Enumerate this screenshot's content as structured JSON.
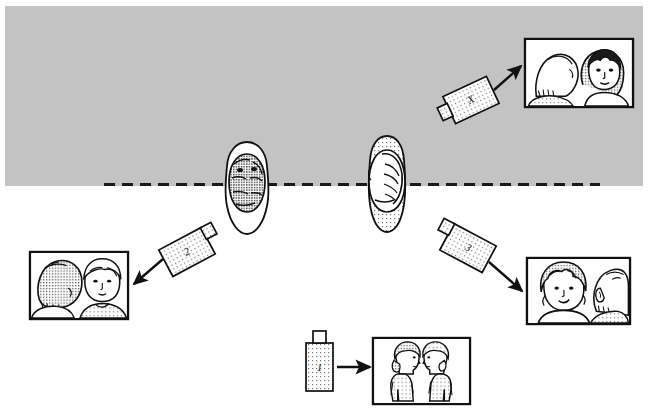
{
  "figure": {
    "background_color": "#ffffff",
    "scene_band": {
      "name": "gray-backdrop-band",
      "fill": "#c3c3c3",
      "x": 5,
      "y": 6,
      "width": 638,
      "height": 180
    },
    "boundary_line": {
      "name": "dashed-boundary-line",
      "style": "dashed",
      "color": "#1a1a1a",
      "y": 184,
      "x_start": 104,
      "x_end": 600,
      "dash": "11 7",
      "thickness": 3
    }
  },
  "subjects": [
    {
      "id": "subject-left",
      "label": "person-top-view-left",
      "description": "person seen from above, dark hair",
      "cx": 247,
      "cy": 185
    },
    {
      "id": "subject-right",
      "label": "person-top-view-right",
      "description": "person seen from above, light hair",
      "cx": 387,
      "cy": 183
    }
  ],
  "cameras": [
    {
      "id": "camera-1",
      "label": "1",
      "orientation": "upright, lens pointing right",
      "rotation": 0,
      "x": 306,
      "y": 341,
      "width": 26,
      "height": 50,
      "fill": "#cfcfcf",
      "points_to": "photo-1"
    },
    {
      "id": "camera-2",
      "label": "2",
      "orientation": "tilted, lens pointing up-right",
      "rotation": -28,
      "x": 163,
      "y": 237,
      "width": 48,
      "height": 30,
      "fill": "#d6d6d6",
      "points_to": "photo-2"
    },
    {
      "id": "camera-3",
      "label": "3",
      "orientation": "tilted, lens pointing up-left",
      "rotation": 28,
      "x": 444,
      "y": 233,
      "width": 48,
      "height": 30,
      "fill": "#d6d6d6",
      "points_to": "photo-3"
    },
    {
      "id": "camera-x",
      "label": "X",
      "orientation": "tilted, lens pointing down-left",
      "rotation": -25,
      "x": 447,
      "y": 85,
      "width": 48,
      "height": 30,
      "fill": "#d6d6d6",
      "points_to": "photo-x"
    }
  ],
  "arrows": [
    {
      "id": "arrow-1",
      "from": "camera-1",
      "to": "photo-1",
      "direction": "right",
      "x1": 338,
      "y1": 366,
      "x2": 372,
      "y2": 366
    },
    {
      "id": "arrow-2",
      "from": "camera-2",
      "to": "photo-2",
      "direction": "down-left",
      "x1": 161,
      "y1": 258,
      "x2": 133,
      "y2": 283
    },
    {
      "id": "arrow-3",
      "from": "camera-3",
      "to": "photo-3",
      "direction": "down-right",
      "x1": 490,
      "y1": 262,
      "x2": 523,
      "y2": 290
    },
    {
      "id": "arrow-x",
      "from": "camera-x",
      "to": "photo-x",
      "direction": "up-right",
      "x1": 494,
      "y1": 90,
      "x2": 522,
      "y2": 66
    }
  ],
  "photos": [
    {
      "id": "photo-x",
      "name": "photo-frame-x",
      "x": 525,
      "y": 39,
      "width": 108,
      "height": 68,
      "caption": "view from camera X",
      "contents": "back of a head on the left, woman facing the camera on the right"
    },
    {
      "id": "photo-2",
      "name": "photo-frame-2",
      "x": 30,
      "y": 252,
      "width": 98,
      "height": 67,
      "caption": "view from camera 2",
      "contents": "back of a head on the left, man facing the camera on the right"
    },
    {
      "id": "photo-3",
      "name": "photo-frame-3",
      "x": 527,
      "y": 258,
      "width": 103,
      "height": 66,
      "caption": "view from camera 3",
      "contents": "woman facing the camera on the left, back of a head on the right"
    },
    {
      "id": "photo-1",
      "name": "photo-frame-1",
      "x": 373,
      "y": 338,
      "width": 97,
      "height": 66,
      "caption": "view from camera 1",
      "contents": "two people shown in profile facing each other"
    }
  ],
  "footer": {
    "cut_off_text": ""
  }
}
